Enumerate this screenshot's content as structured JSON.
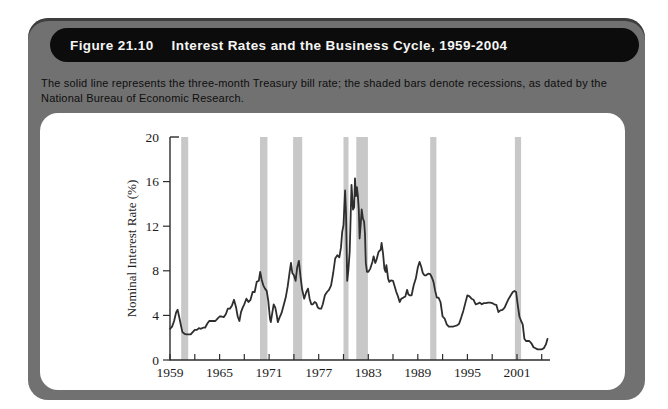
{
  "figure": {
    "label": "Figure 21.10",
    "title": "Interest Rates and the Business Cycle, 1959-2004",
    "caption": "The solid line represents the three-month Treasury bill rate; the shaded bars denote recessions, as dated by the National Bureau of Economic Research."
  },
  "colors": {
    "card_gray": "#717171",
    "title_pill_black": "#0c0c0c",
    "title_text": "#f5f5f5",
    "panel_white": "#ffffff",
    "axis": "#2d2d2d",
    "tick_label": "#1c1c1c",
    "line": "#2e2e2e",
    "recession_band": "#c8c8c8"
  },
  "chart_data": {
    "type": "line",
    "title": "",
    "xlabel": "",
    "ylabel": "Nominal Interest Rate (%)",
    "xlim": [
      1959,
      2005
    ],
    "ylim": [
      0,
      20
    ],
    "grid": false,
    "legend": "none",
    "y_ticks": [
      0,
      4,
      8,
      12,
      16,
      20
    ],
    "x_ticks": [
      1959,
      1962,
      1965,
      1968,
      1971,
      1974,
      1977,
      1980,
      1983,
      1986,
      1989,
      1992,
      1995,
      1998,
      2001,
      2004
    ],
    "x_tick_labels": [
      1959,
      1965,
      1971,
      1977,
      1983,
      1989,
      1995,
      2001
    ],
    "recession_bands": [
      [
        1960.35,
        1961.2
      ],
      [
        1969.9,
        1970.8
      ],
      [
        1973.9,
        1975.0
      ],
      [
        1980.0,
        1980.6
      ],
      [
        1981.55,
        1982.95
      ],
      [
        1990.5,
        1991.25
      ],
      [
        2000.75,
        2001.5
      ]
    ],
    "series": [
      {
        "name": "Three-month Treasury bill rate",
        "points": [
          [
            1959.0,
            2.8
          ],
          [
            1959.25,
            3.0
          ],
          [
            1959.5,
            3.5
          ],
          [
            1959.75,
            4.3
          ],
          [
            1959.92,
            4.5
          ],
          [
            1960.1,
            3.9
          ],
          [
            1960.3,
            3.2
          ],
          [
            1960.5,
            2.5
          ],
          [
            1960.75,
            2.35
          ],
          [
            1961.0,
            2.3
          ],
          [
            1961.25,
            2.3
          ],
          [
            1961.5,
            2.3
          ],
          [
            1961.75,
            2.5
          ],
          [
            1962.0,
            2.7
          ],
          [
            1962.25,
            2.7
          ],
          [
            1962.5,
            2.85
          ],
          [
            1962.75,
            2.8
          ],
          [
            1963.0,
            2.9
          ],
          [
            1963.25,
            2.9
          ],
          [
            1963.5,
            3.25
          ],
          [
            1963.75,
            3.5
          ],
          [
            1964.0,
            3.5
          ],
          [
            1964.25,
            3.5
          ],
          [
            1964.5,
            3.5
          ],
          [
            1964.75,
            3.7
          ],
          [
            1965.0,
            3.9
          ],
          [
            1965.25,
            3.9
          ],
          [
            1965.5,
            3.85
          ],
          [
            1965.75,
            4.1
          ],
          [
            1966.0,
            4.6
          ],
          [
            1966.25,
            4.6
          ],
          [
            1966.5,
            4.9
          ],
          [
            1966.75,
            5.4
          ],
          [
            1967.0,
            4.7
          ],
          [
            1967.2,
            3.9
          ],
          [
            1967.4,
            3.5
          ],
          [
            1967.6,
            4.3
          ],
          [
            1967.8,
            4.7
          ],
          [
            1968.0,
            5.0
          ],
          [
            1968.25,
            5.5
          ],
          [
            1968.5,
            5.2
          ],
          [
            1968.75,
            5.4
          ],
          [
            1969.0,
            6.1
          ],
          [
            1969.25,
            6.1
          ],
          [
            1969.5,
            7.0
          ],
          [
            1969.75,
            7.1
          ],
          [
            1969.92,
            7.9
          ],
          [
            1970.1,
            7.2
          ],
          [
            1970.3,
            6.7
          ],
          [
            1970.5,
            6.4
          ],
          [
            1970.7,
            6.2
          ],
          [
            1970.9,
            5.3
          ],
          [
            1971.1,
            3.7
          ],
          [
            1971.2,
            3.4
          ],
          [
            1971.4,
            4.3
          ],
          [
            1971.55,
            5.0
          ],
          [
            1971.75,
            4.7
          ],
          [
            1971.9,
            4.1
          ],
          [
            1972.05,
            3.4
          ],
          [
            1972.25,
            3.8
          ],
          [
            1972.5,
            4.2
          ],
          [
            1972.75,
            4.9
          ],
          [
            1973.0,
            5.6
          ],
          [
            1973.25,
            6.6
          ],
          [
            1973.5,
            8.0
          ],
          [
            1973.65,
            8.7
          ],
          [
            1973.8,
            7.8
          ],
          [
            1974.0,
            7.6
          ],
          [
            1974.2,
            7.1
          ],
          [
            1974.4,
            8.3
          ],
          [
            1974.6,
            8.9
          ],
          [
            1974.8,
            7.5
          ],
          [
            1975.0,
            6.3
          ],
          [
            1975.25,
            5.5
          ],
          [
            1975.5,
            6.1
          ],
          [
            1975.7,
            6.4
          ],
          [
            1975.9,
            5.5
          ],
          [
            1976.1,
            5.0
          ],
          [
            1976.3,
            5.0
          ],
          [
            1976.5,
            5.2
          ],
          [
            1976.7,
            5.1
          ],
          [
            1976.9,
            4.7
          ],
          [
            1977.1,
            4.6
          ],
          [
            1977.3,
            4.6
          ],
          [
            1977.5,
            5.0
          ],
          [
            1977.75,
            5.8
          ],
          [
            1978.0,
            6.1
          ],
          [
            1978.25,
            6.3
          ],
          [
            1978.5,
            6.7
          ],
          [
            1978.75,
            7.8
          ],
          [
            1979.0,
            9.1
          ],
          [
            1979.25,
            9.4
          ],
          [
            1979.5,
            9.2
          ],
          [
            1979.7,
            10.1
          ],
          [
            1979.85,
            11.5
          ],
          [
            1980.0,
            12.1
          ],
          [
            1980.2,
            15.2
          ],
          [
            1980.3,
            13.2
          ],
          [
            1980.45,
            7.1
          ],
          [
            1980.6,
            8.1
          ],
          [
            1980.75,
            9.7
          ],
          [
            1980.87,
            13.0
          ],
          [
            1980.97,
            15.7
          ],
          [
            1981.05,
            14.7
          ],
          [
            1981.15,
            13.5
          ],
          [
            1981.3,
            13.7
          ],
          [
            1981.4,
            16.3
          ],
          [
            1981.5,
            14.7
          ],
          [
            1981.62,
            15.5
          ],
          [
            1981.75,
            14.7
          ],
          [
            1981.85,
            13.5
          ],
          [
            1981.95,
            10.9
          ],
          [
            1982.1,
            12.3
          ],
          [
            1982.2,
            13.5
          ],
          [
            1982.35,
            12.7
          ],
          [
            1982.5,
            12.4
          ],
          [
            1982.6,
            11.3
          ],
          [
            1982.7,
            8.7
          ],
          [
            1982.85,
            7.9
          ],
          [
            1983.0,
            7.9
          ],
          [
            1983.25,
            8.2
          ],
          [
            1983.5,
            8.8
          ],
          [
            1983.65,
            9.3
          ],
          [
            1983.85,
            8.7
          ],
          [
            1984.0,
            9.0
          ],
          [
            1984.25,
            9.7
          ],
          [
            1984.5,
            9.9
          ],
          [
            1984.62,
            10.5
          ],
          [
            1984.8,
            9.5
          ],
          [
            1984.95,
            8.2
          ],
          [
            1985.1,
            7.9
          ],
          [
            1985.2,
            8.5
          ],
          [
            1985.4,
            7.3
          ],
          [
            1985.55,
            7.0
          ],
          [
            1985.75,
            7.15
          ],
          [
            1986.0,
            7.1
          ],
          [
            1986.2,
            6.6
          ],
          [
            1986.4,
            6.1
          ],
          [
            1986.6,
            5.7
          ],
          [
            1986.8,
            5.2
          ],
          [
            1987.0,
            5.5
          ],
          [
            1987.25,
            5.6
          ],
          [
            1987.5,
            5.7
          ],
          [
            1987.7,
            6.3
          ],
          [
            1987.85,
            5.9
          ],
          [
            1988.0,
            5.8
          ],
          [
            1988.25,
            5.8
          ],
          [
            1988.5,
            6.7
          ],
          [
            1988.75,
            7.3
          ],
          [
            1989.0,
            8.3
          ],
          [
            1989.2,
            8.8
          ],
          [
            1989.4,
            8.4
          ],
          [
            1989.6,
            7.8
          ],
          [
            1989.8,
            7.6
          ],
          [
            1990.0,
            7.6
          ],
          [
            1990.25,
            7.75
          ],
          [
            1990.5,
            7.7
          ],
          [
            1990.7,
            7.4
          ],
          [
            1990.9,
            7.0
          ],
          [
            1991.1,
            6.2
          ],
          [
            1991.3,
            5.6
          ],
          [
            1991.5,
            5.6
          ],
          [
            1991.75,
            5.2
          ],
          [
            1992.0,
            3.9
          ],
          [
            1992.25,
            3.7
          ],
          [
            1992.5,
            3.2
          ],
          [
            1992.75,
            3.0
          ],
          [
            1993.0,
            3.0
          ],
          [
            1993.25,
            3.0
          ],
          [
            1993.5,
            3.05
          ],
          [
            1993.75,
            3.1
          ],
          [
            1994.0,
            3.25
          ],
          [
            1994.25,
            3.8
          ],
          [
            1994.5,
            4.4
          ],
          [
            1994.75,
            5.1
          ],
          [
            1995.0,
            5.8
          ],
          [
            1995.25,
            5.7
          ],
          [
            1995.5,
            5.5
          ],
          [
            1995.75,
            5.4
          ],
          [
            1996.0,
            5.0
          ],
          [
            1996.25,
            5.05
          ],
          [
            1996.5,
            5.15
          ],
          [
            1996.75,
            5.0
          ],
          [
            1997.0,
            5.1
          ],
          [
            1997.25,
            5.1
          ],
          [
            1997.5,
            5.15
          ],
          [
            1997.75,
            5.15
          ],
          [
            1998.0,
            5.1
          ],
          [
            1998.25,
            5.0
          ],
          [
            1998.5,
            4.95
          ],
          [
            1998.75,
            4.3
          ],
          [
            1999.0,
            4.45
          ],
          [
            1999.25,
            4.5
          ],
          [
            1999.5,
            4.7
          ],
          [
            1999.75,
            5.1
          ],
          [
            2000.0,
            5.5
          ],
          [
            2000.25,
            5.8
          ],
          [
            2000.5,
            6.1
          ],
          [
            2000.7,
            6.2
          ],
          [
            2000.9,
            6.1
          ],
          [
            2001.1,
            4.9
          ],
          [
            2001.3,
            3.9
          ],
          [
            2001.5,
            3.5
          ],
          [
            2001.7,
            3.2
          ],
          [
            2001.9,
            1.9
          ],
          [
            2002.1,
            1.7
          ],
          [
            2002.3,
            1.7
          ],
          [
            2002.5,
            1.7
          ],
          [
            2002.75,
            1.5
          ],
          [
            2003.0,
            1.15
          ],
          [
            2003.25,
            1.05
          ],
          [
            2003.5,
            0.95
          ],
          [
            2003.75,
            0.95
          ],
          [
            2004.0,
            0.95
          ],
          [
            2004.25,
            1.05
          ],
          [
            2004.5,
            1.4
          ],
          [
            2004.7,
            1.9
          ]
        ]
      }
    ]
  }
}
